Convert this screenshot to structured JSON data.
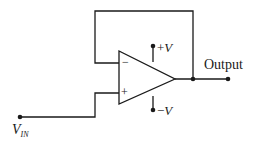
{
  "diagram": {
    "type": "op-amp voltage follower (buffer)",
    "labels": {
      "output": "Output",
      "pos_supply_sign": "+",
      "pos_supply_var": "V",
      "neg_supply_sign": "−",
      "neg_supply_var": "V",
      "input_main": "V",
      "input_sub": "IN",
      "inverting_input": "−",
      "noninverting_input": "+"
    },
    "colors": {
      "line": "#1a1a1a",
      "background": "#ffffff"
    }
  }
}
